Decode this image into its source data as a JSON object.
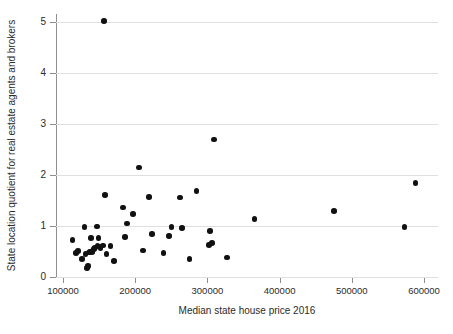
{
  "chart_data": {
    "type": "scatter",
    "title": "",
    "subtitle": "",
    "xlabel": "Median state house price 2016",
    "ylabel": "State location quotient for real estate agents and brokers",
    "xlim": [
      100000,
      620000
    ],
    "ylim": [
      0,
      5.2
    ],
    "xticks": [
      100000,
      200000,
      300000,
      400000,
      500000,
      600000
    ],
    "xtick_labels": [
      "100000",
      "200000",
      "300000",
      "400000",
      "500000",
      "600000"
    ],
    "yticks": [
      0,
      1,
      2,
      3,
      4,
      5
    ],
    "ytick_labels": [
      "0",
      "1",
      "2",
      "3",
      "4",
      "5"
    ],
    "grid": "horizontal",
    "legend": null,
    "marker": {
      "shape": "circle",
      "color": "#111111",
      "size_px": 5.6
    },
    "n_points": 51,
    "annotations": [],
    "points": [
      {
        "x": 113000,
        "y": 0.73
      },
      {
        "x": 118000,
        "y": 0.47
      },
      {
        "x": 121000,
        "y": 0.51
      },
      {
        "x": 126000,
        "y": 0.35
      },
      {
        "x": 130000,
        "y": 0.98
      },
      {
        "x": 131000,
        "y": 0.45
      },
      {
        "x": 133000,
        "y": 0.18
      },
      {
        "x": 135000,
        "y": 0.22
      },
      {
        "x": 136000,
        "y": 0.48
      },
      {
        "x": 137000,
        "y": 0.5
      },
      {
        "x": 138000,
        "y": 0.5
      },
      {
        "x": 139000,
        "y": 0.76
      },
      {
        "x": 140000,
        "y": 0.49
      },
      {
        "x": 141000,
        "y": 0.51
      },
      {
        "x": 143000,
        "y": 0.55
      },
      {
        "x": 144000,
        "y": 0.58
      },
      {
        "x": 147000,
        "y": 0.99
      },
      {
        "x": 148000,
        "y": 0.62
      },
      {
        "x": 149000,
        "y": 0.77
      },
      {
        "x": 150000,
        "y": 0.6
      },
      {
        "x": 152000,
        "y": 0.57
      },
      {
        "x": 155000,
        "y": 0.62
      },
      {
        "x": 157000,
        "y": 5.02
      },
      {
        "x": 158000,
        "y": 1.61
      },
      {
        "x": 160000,
        "y": 0.45
      },
      {
        "x": 166000,
        "y": 0.61
      },
      {
        "x": 171000,
        "y": 0.31
      },
      {
        "x": 183000,
        "y": 1.36
      },
      {
        "x": 186000,
        "y": 0.79
      },
      {
        "x": 189000,
        "y": 1.05
      },
      {
        "x": 197000,
        "y": 1.23
      },
      {
        "x": 205000,
        "y": 2.15
      },
      {
        "x": 211000,
        "y": 0.52
      },
      {
        "x": 219000,
        "y": 1.57
      },
      {
        "x": 223000,
        "y": 0.84
      },
      {
        "x": 239000,
        "y": 0.47
      },
      {
        "x": 247000,
        "y": 0.8
      },
      {
        "x": 250000,
        "y": 0.98
      },
      {
        "x": 262000,
        "y": 1.56
      },
      {
        "x": 265000,
        "y": 0.96
      },
      {
        "x": 275000,
        "y": 0.35
      },
      {
        "x": 285000,
        "y": 1.69
      },
      {
        "x": 302000,
        "y": 0.63
      },
      {
        "x": 304000,
        "y": 0.9
      },
      {
        "x": 306000,
        "y": 0.67
      },
      {
        "x": 309000,
        "y": 2.7
      },
      {
        "x": 327000,
        "y": 0.38
      },
      {
        "x": 365000,
        "y": 1.14
      },
      {
        "x": 475000,
        "y": 1.29
      },
      {
        "x": 573000,
        "y": 0.98
      },
      {
        "x": 588000,
        "y": 1.84
      }
    ]
  }
}
